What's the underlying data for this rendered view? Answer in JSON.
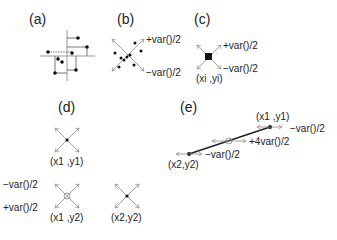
{
  "panels": {
    "a": {
      "label": "(a)"
    },
    "b": {
      "label": "(b)",
      "plus": "+var()/2",
      "minus": "−var()/2"
    },
    "c": {
      "label": "(c)",
      "plus": "+var()/2",
      "minus": "−var()/2",
      "point": "(xi ,yi)"
    },
    "d": {
      "label": "(d)",
      "p1": "(x1 ,y1)",
      "p2": "(x1 ,y2)",
      "p3": "(x2,y2)",
      "minus": "−var()/2",
      "plus": "+var()/2"
    },
    "e": {
      "label": "(e)",
      "p1": "(x1 ,y1)",
      "p2": "(x2,y2)",
      "minus1": "−var()/2",
      "mid": "+4var()/2",
      "minus2": "−var()/2"
    }
  },
  "colors": {
    "ink": "#222222",
    "arrow": "#888888",
    "axis": "#999999"
  }
}
